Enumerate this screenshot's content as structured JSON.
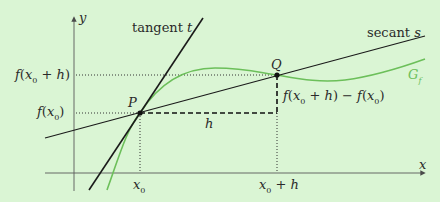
{
  "diagram": {
    "background_color": "#daf5d4",
    "axes": {
      "x_label": "x",
      "y_label": "y"
    },
    "lines": {
      "tangent_label": "tangent t",
      "secant_label": "secant s"
    },
    "curve": {
      "label": "G_f",
      "label_main": "G",
      "label_sub": "f",
      "color": "#6cbf5a"
    },
    "points": {
      "P": "P",
      "Q": "Q"
    },
    "ticks": {
      "x0": "x0",
      "x0_main": "x",
      "x0_sub": "0",
      "x0_plus_h": "x0 + h",
      "y_f_x0": "f(x0)",
      "y_f_x0_plus_h": "f(x0 + h)"
    },
    "annotations": {
      "h": "h",
      "difference": "f(x0 + h) − f(x0)"
    },
    "colors": {
      "line": "#1a1a1a",
      "axis": "#4a4a4a",
      "curve": "#6cbf5a"
    }
  }
}
